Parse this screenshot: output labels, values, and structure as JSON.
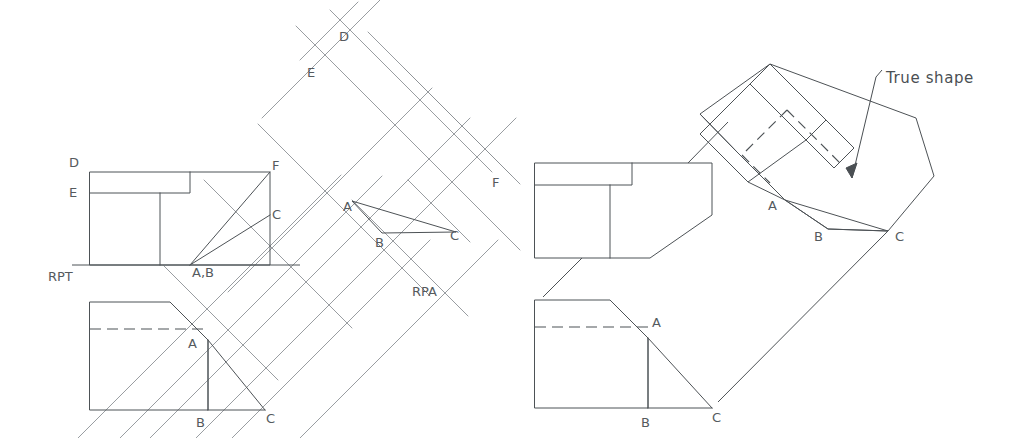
{
  "drawing": {
    "title": "Auxiliary view - true shape construction",
    "colors": {
      "object_line": "#4d5256",
      "projection_line": "#8d9296",
      "hidden_line": "#4d5256",
      "reference_line": "#4d5256",
      "text": "#555a5e",
      "background": "#ffffff",
      "note_text": "#4a4f53"
    },
    "line_widths": {
      "object": 1.0,
      "projection": 0.9,
      "hidden": 1.1,
      "reference": 1.0
    },
    "hidden_dash_pattern": "10 6"
  },
  "labels": {
    "reference_plane_top": "RPT",
    "reference_plane_aux": "RPA",
    "note_true_shape": "True shape",
    "front_view": {
      "d": "D",
      "e": "E",
      "f": "F",
      "c": "C",
      "ab": "A,B"
    },
    "top_view": {
      "a": "A",
      "b": "B",
      "c": "C"
    },
    "aux_view": {
      "d": "D",
      "e": "E",
      "f": "F",
      "a": "A",
      "b": "B",
      "c": "C"
    },
    "right_front_view": {},
    "right_top_view": {
      "a": "A",
      "b": "B",
      "c": "C"
    },
    "rotated_view": {
      "a": "A",
      "b": "B",
      "c": "C"
    }
  },
  "label_positions": {
    "rpt": {
      "x": 48,
      "y": 281
    },
    "rpa": {
      "x": 412,
      "y": 296
    },
    "true_shape": {
      "x": 886,
      "y": 83
    },
    "fv_d": {
      "x": 69,
      "y": 167
    },
    "fv_e": {
      "x": 69,
      "y": 197
    },
    "fv_f": {
      "x": 272,
      "y": 170
    },
    "fv_c": {
      "x": 272,
      "y": 219
    },
    "fv_ab": {
      "x": 192,
      "y": 277
    },
    "tv_a": {
      "x": 188,
      "y": 348
    },
    "tv_b": {
      "x": 196,
      "y": 427
    },
    "tv_c": {
      "x": 266,
      "y": 423
    },
    "aux_d": {
      "x": 339,
      "y": 41
    },
    "aux_e": {
      "x": 307,
      "y": 77
    },
    "aux_f": {
      "x": 492,
      "y": 187
    },
    "aux_a": {
      "x": 343,
      "y": 211
    },
    "aux_b": {
      "x": 375,
      "y": 247
    },
    "aux_c": {
      "x": 450,
      "y": 240
    },
    "rv_a": {
      "x": 772,
      "y": 210
    },
    "rv_b": {
      "x": 817,
      "y": 238
    },
    "rv_c": {
      "x": 897,
      "y": 240
    },
    "rtv_a": {
      "x": 650,
      "y": 327
    },
    "rtv_b": {
      "x": 643,
      "y": 427
    },
    "rtv_c": {
      "x": 712,
      "y": 422
    }
  },
  "geometry": {
    "left_front_view": {
      "outline": "M 90,172 L 270,172 L 270,265 L 90,265 Z",
      "notch_bottom": "M 90,193 L 190,193 L 190,172",
      "inner_vertical": "M 160,193 L 160,265"
    },
    "left_reference_line_rpt": {
      "x1": 72,
      "y1": 265,
      "x2": 300,
      "y2": 265
    },
    "left_top_view": {
      "outline": "M 90,302 L 170,302 L 208,340 L 208,410 L 265,410 L 265,410 L 90,410 Z",
      "hidden_line": {
        "x1": 90,
        "y1": 329,
        "x2": 208,
        "y2": 329
      },
      "vertical_ab": {
        "x1": 208,
        "y1": 340,
        "x2": 208,
        "y2": 410
      },
      "diag_ac": {
        "x1": 208,
        "y1": 340,
        "x2": 265,
        "y2": 410
      },
      "bottom": {
        "x1": 90,
        "y1": 410,
        "x2": 265,
        "y2": 410
      }
    },
    "aux_triangle": {
      "a": {
        "x": 352,
        "y": 201
      },
      "b": {
        "x": 382,
        "y": 233
      },
      "c": {
        "x": 456,
        "y": 232
      }
    },
    "rotated_triangle": {
      "a": {
        "x": 785,
        "y": 200
      },
      "b": {
        "x": 828,
        "y": 229
      },
      "c": {
        "x": 888,
        "y": 231
      }
    },
    "right_front_view": {
      "outline": "M 535,163 L 712,163 L 712,215 L 672,255 L 650,255 L 650,258 L 535,258 Z",
      "notch": "M 535,185 L 632,185 L 632,163",
      "inner_vertical": "M 610,185 L 610,258"
    },
    "right_top_view": {
      "outline": "M 535,300 L 610,300 L 648,338 L 648,408 L 712,408 L 535,408 Z",
      "hidden_line": {
        "x1": 535,
        "y1": 327,
        "x2": 648,
        "y2": 327
      }
    },
    "projection_angle_deg": 45
  },
  "projection_lines": {
    "count_family_a": 7,
    "count_family_b": 6,
    "description": "Two families of parallel 45-degree construction lines forming the auxiliary projection grid"
  }
}
